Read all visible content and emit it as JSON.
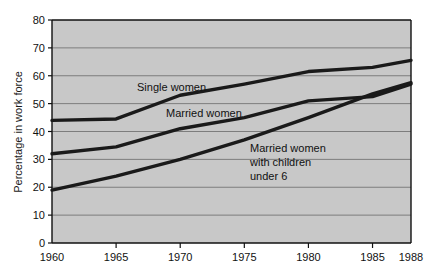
{
  "chart_data": {
    "type": "line",
    "title": "",
    "xlabel": "",
    "ylabel": "Percentage in work force",
    "x": [
      1960,
      1965,
      1970,
      1975,
      1980,
      1985,
      1988
    ],
    "xtick_labels": [
      "1960",
      "1965",
      "1970",
      "1975",
      "1980",
      "1985",
      "1988"
    ],
    "ytick_labels": [
      "0",
      "10",
      "20",
      "30",
      "40",
      "50",
      "60",
      "70",
      "80"
    ],
    "ytick_values": [
      0,
      10,
      20,
      30,
      40,
      50,
      60,
      70,
      80
    ],
    "xlim": [
      1960,
      1988
    ],
    "ylim": [
      0,
      80
    ],
    "grid": "horizontal",
    "legend_position": "inline-annotations",
    "plot_background": "#c8c8c8",
    "page_background": "#ffffff",
    "line_color": "#1a1a1a",
    "grid_color": "#7d7d7d",
    "axis_color": "#111111",
    "series": [
      {
        "name": "Single women",
        "label": "Single women",
        "values": [
          44,
          44.5,
          53,
          57,
          61.5,
          63,
          65.5
        ]
      },
      {
        "name": "Married women",
        "label": "Married women",
        "values": [
          32,
          34.5,
          41,
          45,
          51,
          52.5,
          57
        ]
      },
      {
        "name": "Married women with children under 6",
        "label_lines": [
          "Married women",
          "with children",
          "under 6"
        ],
        "values": [
          19,
          24,
          30,
          37,
          45,
          53.5,
          57.5
        ]
      }
    ],
    "annotations": [
      {
        "text": "Single women",
        "x_px": 137,
        "y_px": 91
      },
      {
        "text": "Married women",
        "x_px": 166,
        "y_px": 117
      },
      {
        "text": "Married women",
        "x_px": 250,
        "y_px": 152
      },
      {
        "text": "with children",
        "x_px": 250,
        "y_px": 166
      },
      {
        "text": "under 6",
        "x_px": 250,
        "y_px": 180
      }
    ]
  }
}
